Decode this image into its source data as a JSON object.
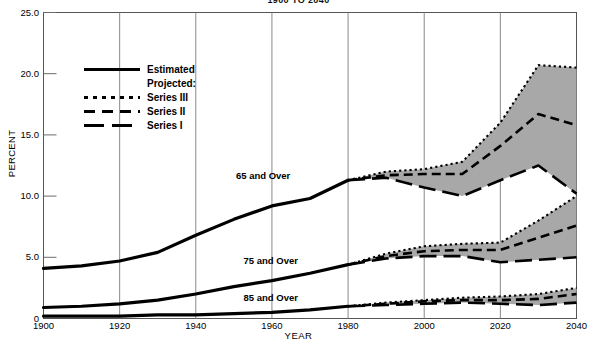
{
  "chart_data": {
    "type": "line",
    "title": "1900 TO 2040",
    "xlabel": "YEAR",
    "ylabel": "PERCENT",
    "xlim": [
      1900,
      2040
    ],
    "ylim": [
      0,
      25
    ],
    "ytick_labels": [
      "0",
      "5.0",
      "10.0",
      "15.0",
      "20.0",
      "25.0"
    ],
    "ytick_values": [
      0,
      5,
      10,
      15,
      20,
      25
    ],
    "xtick_labels": [
      "1900",
      "1920",
      "1940",
      "1960",
      "1980",
      "2000",
      "2020",
      "2040"
    ],
    "xtick_values": [
      1900,
      1920,
      1940,
      1960,
      1980,
      2000,
      2020,
      2040
    ],
    "grid": false,
    "legend_position": "upper-left",
    "band_fill_color": "#a8a8a8",
    "line_color": "#000000",
    "groups": [
      {
        "name": "65 and Over",
        "label": "65 and Over",
        "label_x": 1960,
        "label_y": 11.6,
        "estimated": {
          "name": "Estimated",
          "x": [
            1900,
            1910,
            1920,
            1930,
            1940,
            1950,
            1960,
            1970,
            1980
          ],
          "values": [
            4.1,
            4.3,
            4.7,
            5.4,
            6.8,
            8.1,
            9.2,
            9.8,
            11.3
          ]
        },
        "projected": [
          {
            "name": "Series III",
            "x": [
              1980,
              1990,
              2000,
              2010,
              2020,
              2030,
              2040
            ],
            "values": [
              11.3,
              12.0,
              12.2,
              12.8,
              16.0,
              20.7,
              20.5
            ]
          },
          {
            "name": "Series II",
            "x": [
              1980,
              1990,
              2000,
              2010,
              2020,
              2030,
              2040
            ],
            "values": [
              11.3,
              11.7,
              11.8,
              11.8,
              14.1,
              16.7,
              15.8
            ]
          },
          {
            "name": "Series I",
            "x": [
              1980,
              1990,
              2000,
              2010,
              2020,
              2030,
              2040
            ],
            "values": [
              11.3,
              11.5,
              10.7,
              10.0,
              11.3,
              12.5,
              10.2
            ]
          }
        ]
      },
      {
        "name": "75 and Over",
        "label": "75 and Over",
        "label_x": 1962,
        "label_y": 4.6,
        "estimated": {
          "name": "Estimated",
          "x": [
            1900,
            1910,
            1920,
            1930,
            1940,
            1950,
            1960,
            1970,
            1980
          ],
          "values": [
            0.9,
            1.0,
            1.2,
            1.5,
            2.0,
            2.6,
            3.1,
            3.7,
            4.4
          ]
        },
        "projected": [
          {
            "name": "Series III",
            "x": [
              1980,
              1990,
              2000,
              2010,
              2020,
              2030,
              2040
            ],
            "values": [
              4.4,
              5.3,
              5.9,
              6.1,
              6.2,
              8.0,
              10.0
            ]
          },
          {
            "name": "Series II",
            "x": [
              1980,
              1990,
              2000,
              2010,
              2020,
              2030,
              2040
            ],
            "values": [
              4.4,
              5.1,
              5.5,
              5.6,
              5.6,
              6.6,
              7.6
            ]
          },
          {
            "name": "Series I",
            "x": [
              1980,
              1990,
              2000,
              2010,
              2020,
              2030,
              2040
            ],
            "values": [
              4.4,
              4.9,
              5.1,
              5.1,
              4.6,
              4.8,
              5.0
            ]
          }
        ]
      },
      {
        "name": "85 and Over",
        "label": "85 and Over",
        "label_x": 1962,
        "label_y": 1.6,
        "estimated": {
          "name": "Estimated",
          "x": [
            1900,
            1910,
            1920,
            1930,
            1940,
            1950,
            1960,
            1970,
            1980
          ],
          "values": [
            0.2,
            0.2,
            0.2,
            0.3,
            0.3,
            0.4,
            0.5,
            0.7,
            1.0
          ]
        },
        "projected": [
          {
            "name": "Series III",
            "x": [
              1980,
              1990,
              2000,
              2010,
              2020,
              2030,
              2040
            ],
            "values": [
              1.0,
              1.3,
              1.5,
              1.7,
              1.8,
              2.0,
              2.5
            ]
          },
          {
            "name": "Series II",
            "x": [
              1980,
              1990,
              2000,
              2010,
              2020,
              2030,
              2040
            ],
            "values": [
              1.0,
              1.2,
              1.4,
              1.5,
              1.5,
              1.6,
              2.0
            ]
          },
          {
            "name": "Series I",
            "x": [
              1980,
              1990,
              2000,
              2010,
              2020,
              2030,
              2040
            ],
            "values": [
              1.0,
              1.1,
              1.2,
              1.3,
              1.2,
              1.1,
              1.3
            ]
          }
        ]
      }
    ]
  },
  "legend": {
    "estimated_label": "Estimated",
    "projected_label": "Projected:",
    "series3_label": "Series III",
    "series2_label": "Series II",
    "series1_label": "Series I"
  }
}
